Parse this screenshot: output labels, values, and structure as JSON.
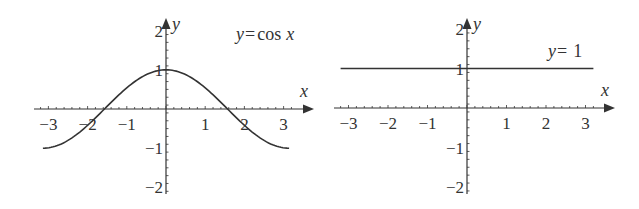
{
  "chart_data": [
    {
      "type": "line",
      "title": "y = cos x",
      "label": "y = cos x",
      "label_parts": {
        "y": "y",
        "eq": "=",
        "fn": "cos",
        "x": "x"
      },
      "xlabel": "x",
      "ylabel": "y",
      "xlim": [
        -3.3,
        3.3
      ],
      "ylim": [
        -2.2,
        2.2
      ],
      "x_ticks": [
        -3,
        -2,
        -1,
        1,
        2,
        3
      ],
      "y_ticks": [
        2,
        1,
        -1,
        -2
      ],
      "x_tick_labels": [
        "−3",
        "−2",
        "−1",
        "1",
        "2",
        "3"
      ],
      "y_tick_labels": [
        "2",
        "1",
        "−1",
        "−2"
      ],
      "grid": false,
      "series": [
        {
          "name": "cos x",
          "domain": [
            -3.14,
            3.14
          ],
          "function": "cos"
        }
      ],
      "color": "#333333"
    },
    {
      "type": "line",
      "title": "y = 1",
      "label": "y = 1",
      "label_parts": {
        "y": "y",
        "eq": "=",
        "val": "1"
      },
      "xlabel": "x",
      "ylabel": "y",
      "xlim": [
        -3.3,
        3.3
      ],
      "ylim": [
        -2.2,
        2.2
      ],
      "x_ticks": [
        -3,
        -2,
        -1,
        1,
        2,
        3
      ],
      "y_ticks": [
        2,
        1,
        -1,
        -2
      ],
      "x_tick_labels": [
        "−3",
        "−2",
        "−1",
        "1",
        "2",
        "3"
      ],
      "y_tick_labels": [
        "2",
        "1",
        "−1",
        "−2"
      ],
      "grid": false,
      "series": [
        {
          "name": "1",
          "domain": [
            -3.2,
            3.2
          ],
          "function": "constant",
          "value": 1
        }
      ],
      "color": "#333333"
    }
  ]
}
